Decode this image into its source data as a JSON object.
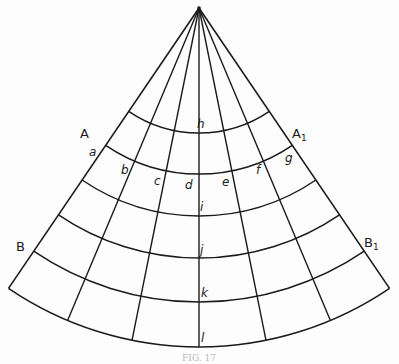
{
  "figure": {
    "caption": "FIG. 17",
    "apex": {
      "x": 199,
      "y": 8
    },
    "half_angle_deg": 34.2,
    "meridian_count": 7,
    "parallel_radii": [
      125,
      166,
      208,
      250,
      294,
      339
    ],
    "line_color": "#1a1a1a"
  },
  "labels": {
    "A": "A",
    "A1_main": "A",
    "A1_sub": "1",
    "B": "B",
    "B1_main": "B",
    "B1_sub": "1",
    "a": "a",
    "b": "b",
    "c": "c",
    "d": "d",
    "e": "e",
    "f": "f",
    "g": "g",
    "h": "h",
    "i": "i",
    "j": "j",
    "k": "k",
    "l": "l"
  }
}
